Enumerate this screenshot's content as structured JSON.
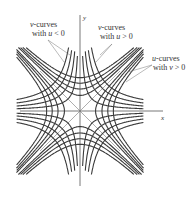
{
  "diagram": {
    "axes": {
      "x_label": "x",
      "y_label": "y"
    },
    "annotations": [
      {
        "id": "v-neg",
        "line1": "v-curves",
        "line2_prefix": "with ",
        "var": "u",
        "rel": " < 0"
      },
      {
        "id": "v-pos",
        "line1": "v-curves",
        "line2_prefix": "with ",
        "var": "u",
        "rel": " > 0"
      },
      {
        "id": "u-pos",
        "line1": "u-curves",
        "line2_prefix": "with ",
        "var": "v",
        "rel": " > 0"
      }
    ],
    "families": {
      "axis_hyperbolas_c": [
        0.5,
        1.0,
        1.6,
        2.3
      ],
      "diagonal_hyperbolas_c": [
        0.3,
        0.65,
        1.05,
        1.5
      ]
    },
    "stroke_color": "#3a3a3a",
    "leader_color": "#666666"
  }
}
